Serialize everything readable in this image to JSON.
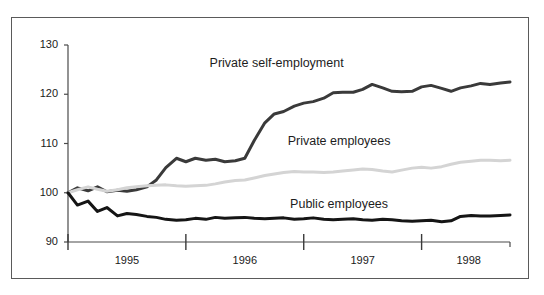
{
  "figure": {
    "background_color": "#ffffff",
    "border_color": "#5a5a5a"
  },
  "chart_data": {
    "type": "line",
    "title": "",
    "subtitle": "",
    "xlabel": "",
    "ylabel": "",
    "xlim": [
      1994.75,
      1998.5
    ],
    "ylim": [
      90,
      130
    ],
    "yticks": [
      90,
      100,
      110,
      120,
      130
    ],
    "ytick_labels": [
      "90",
      "100",
      "110",
      "120",
      "130"
    ],
    "xticks": [
      1994.75,
      1995.75,
      1996.75,
      1997.75
    ],
    "xtick_labels": [
      "1995",
      "1996",
      "1997",
      "1998"
    ],
    "xtick_label_positions": [
      1995.25,
      1996.25,
      1997.25,
      1998.15
    ],
    "grid": false,
    "legend": "inline-annotations",
    "index_base": 100,
    "x": [
      1994.75,
      1994.83,
      1994.92,
      1995.0,
      1995.08,
      1995.17,
      1995.25,
      1995.33,
      1995.42,
      1995.5,
      1995.58,
      1995.67,
      1995.75,
      1995.83,
      1995.92,
      1996.0,
      1996.08,
      1996.17,
      1996.25,
      1996.33,
      1996.42,
      1996.5,
      1996.58,
      1996.67,
      1996.75,
      1996.83,
      1996.92,
      1997.0,
      1997.08,
      1997.17,
      1997.25,
      1997.33,
      1997.42,
      1997.5,
      1997.58,
      1997.67,
      1997.75,
      1997.83,
      1997.92,
      1998.0,
      1998.08,
      1998.17,
      1998.25,
      1998.33,
      1998.42,
      1998.5
    ],
    "series": [
      {
        "name": "Private self-employment",
        "label": "Private self-employment",
        "color": "#3a3a3a",
        "line_width": 3,
        "label_x": 1996.52,
        "label_y": 126.2,
        "values": [
          100.0,
          101.0,
          100.4,
          101.2,
          100.2,
          100.5,
          100.3,
          100.6,
          101.2,
          102.6,
          105.1,
          107.0,
          106.3,
          107.0,
          106.6,
          106.8,
          106.3,
          106.5,
          107.0,
          110.6,
          114.2,
          116.0,
          116.5,
          117.6,
          118.2,
          118.5,
          119.2,
          120.3,
          120.4,
          120.4,
          121.0,
          122.0,
          121.3,
          120.6,
          120.5,
          120.6,
          121.5,
          121.8,
          121.2,
          120.6,
          121.3,
          121.7,
          122.2,
          122.0,
          122.3,
          122.5
        ]
      },
      {
        "name": "Private employees",
        "label": "Private employees",
        "color": "#d4d4d4",
        "line_width": 3,
        "label_x": 1997.05,
        "label_y": 110.3,
        "values": [
          100.0,
          100.6,
          101.2,
          100.7,
          100.3,
          100.6,
          101.0,
          101.2,
          101.4,
          101.5,
          101.6,
          101.4,
          101.3,
          101.4,
          101.5,
          101.8,
          102.2,
          102.5,
          102.6,
          103.0,
          103.5,
          103.8,
          104.1,
          104.3,
          104.2,
          104.2,
          104.1,
          104.2,
          104.4,
          104.6,
          104.8,
          104.7,
          104.4,
          104.2,
          104.6,
          105.0,
          105.2,
          105.0,
          105.3,
          105.8,
          106.2,
          106.4,
          106.6,
          106.6,
          106.5,
          106.6
        ]
      },
      {
        "name": "Public employees",
        "label": "Public employees",
        "color": "#151515",
        "line_width": 3,
        "label_x": 1997.05,
        "label_y": 97.6,
        "values": [
          100.0,
          97.5,
          98.3,
          96.2,
          97.0,
          95.3,
          95.8,
          95.6,
          95.2,
          95.0,
          94.6,
          94.4,
          94.5,
          94.8,
          94.6,
          95.0,
          94.8,
          94.9,
          95.0,
          94.8,
          94.7,
          94.8,
          94.9,
          94.6,
          94.7,
          94.9,
          94.6,
          94.5,
          94.6,
          94.7,
          94.5,
          94.4,
          94.6,
          94.5,
          94.3,
          94.2,
          94.3,
          94.4,
          94.1,
          94.3,
          95.2,
          95.4,
          95.3,
          95.3,
          95.4,
          95.5
        ]
      }
    ]
  }
}
